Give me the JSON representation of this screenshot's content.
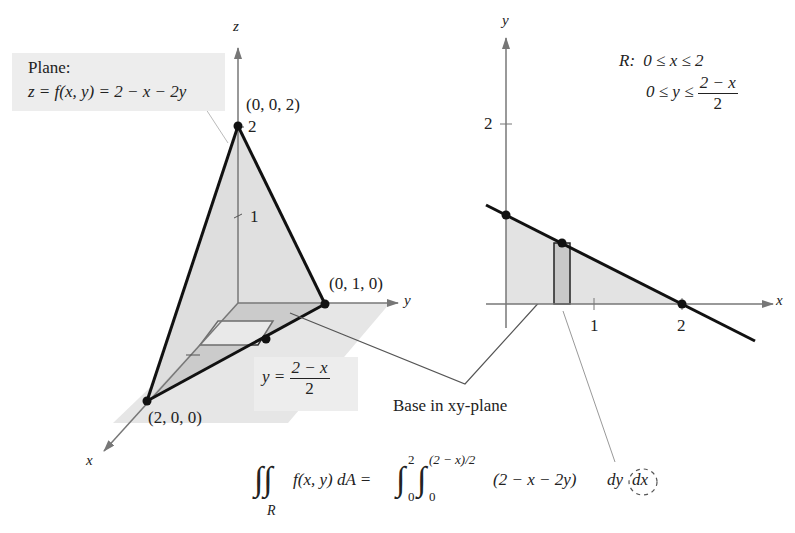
{
  "figure": {
    "left_panel": {
      "axes": {
        "x_label": "x",
        "y_label": "y",
        "z_label": "z"
      },
      "z_ticks": [
        "1",
        "2"
      ],
      "plane_callout": {
        "title": "Plane:",
        "equation": "z = f(x, y) = 2 − x − 2y"
      },
      "points": [
        {
          "label": "(0, 0, 2)"
        },
        {
          "label": "(0, 1, 0)"
        },
        {
          "label": "(2, 0, 0)"
        }
      ],
      "boundary_callout": {
        "lhs": "y =",
        "numerator": "2 − x",
        "denominator": "2"
      }
    },
    "right_panel": {
      "axes": {
        "x_label": "x",
        "y_label": "y"
      },
      "x_ticks": [
        "1",
        "2"
      ],
      "y_ticks": [
        "2"
      ],
      "region": {
        "label": "R:",
        "x_bounds": "0 ≤ x ≤ 2",
        "y_bounds_prefix": "0 ≤ y ≤",
        "y_upper_numerator": "2 − x",
        "y_upper_denominator": "2"
      }
    },
    "connector_label": "Base in xy-plane",
    "integral": {
      "lhs_region": "R",
      "lhs_body": "f(x, y) dA =",
      "outer_lower": "0",
      "outer_upper": "2",
      "inner_lower": "0",
      "inner_upper": "(2 − x)/2",
      "integrand": "(2 − x − 2y)",
      "dy": "dy",
      "dx": "dx"
    },
    "colors": {
      "fill_light": "#e3e3e3",
      "fill_base": "#d4d4d4",
      "fill_dark": "#bdbdbd",
      "axis": "#777777",
      "edge": "#111111",
      "callout_bg": "#ededed"
    }
  }
}
